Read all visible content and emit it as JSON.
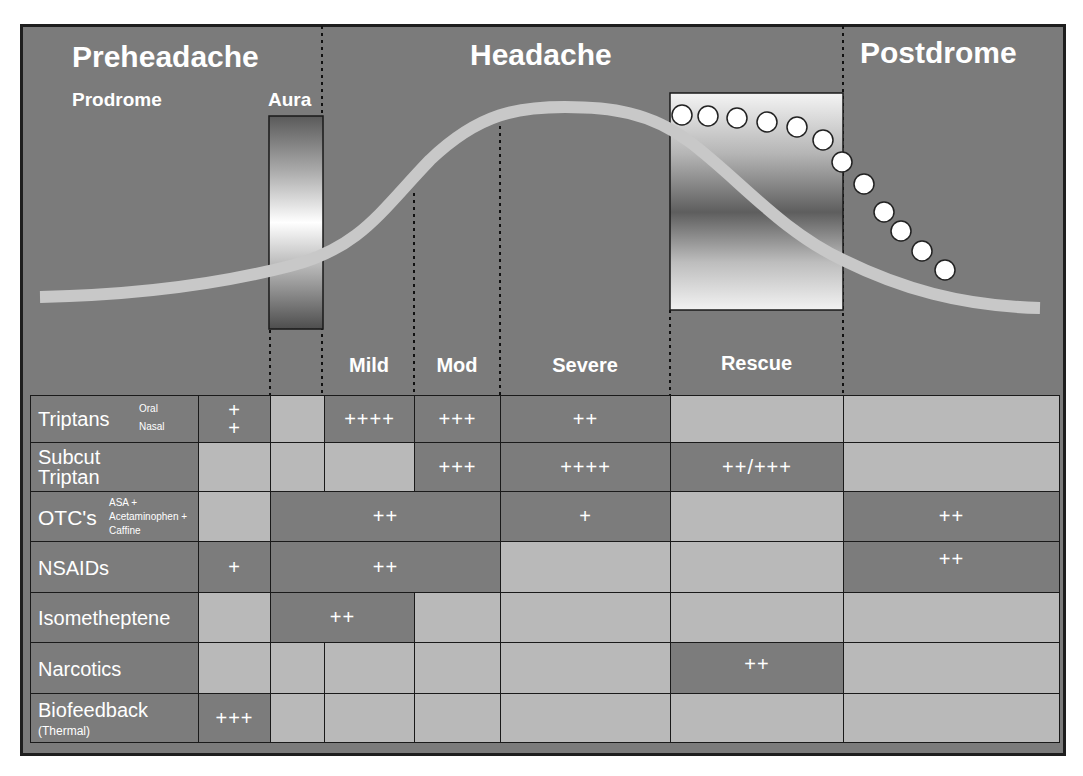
{
  "phases": {
    "preheadache": "Preheadache",
    "headache": "Headache",
    "postdrome": "Postdrome"
  },
  "subphases": {
    "prodrome": "Prodrome",
    "aura": "Aura"
  },
  "column_headers": {
    "mild": "Mild",
    "mod": "Mod",
    "severe": "Severe",
    "rescue": "Rescue"
  },
  "rows": [
    {
      "label": "Triptans",
      "sublabel_1": "Oral",
      "sublabel_2": "Nasal",
      "cells": {
        "prodrome_top": "+",
        "prodrome_bottom": "+",
        "mild": "++++",
        "mod": "+++",
        "severe": "++"
      }
    },
    {
      "label_1": "Subcut",
      "label_2": "Triptan",
      "cells": {
        "mod": "+++",
        "severe": "++++",
        "rescue": "++/+++"
      }
    },
    {
      "label": "OTC's",
      "sublabel_1": "ASA +",
      "sublabel_2": "Acetaminophen +",
      "sublabel_3": "Caffine",
      "cells": {
        "aura_to_mod": "++",
        "severe": "+",
        "postdrome": "++"
      }
    },
    {
      "label": "NSAIDs",
      "cells": {
        "prodrome": "+",
        "aura_to_mod": "++",
        "postdrome": "++"
      }
    },
    {
      "label": "Isometheptene",
      "cells": {
        "aura_to_mild": "++"
      }
    },
    {
      "label": "Narcotics",
      "cells": {
        "rescue": "++"
      }
    },
    {
      "label": "Biofeedback",
      "sublabel": "(Thermal)",
      "cells": {
        "prodrome": "+++"
      }
    }
  ],
  "colors": {
    "background": "#7b7b7b",
    "active_cell": "#7c7c7c",
    "inactive_cell": "#b9b9b9",
    "curve": "#c8c8c8",
    "text": "#ffffff"
  }
}
